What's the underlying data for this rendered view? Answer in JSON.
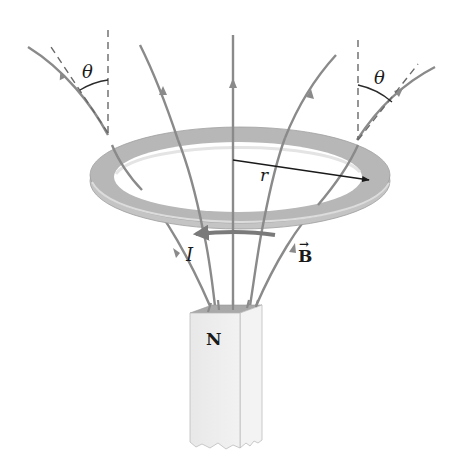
{
  "figure": {
    "labels": {
      "theta_left": "θ",
      "theta_right": "θ",
      "radius": "r",
      "current": "I",
      "field": "B",
      "field_vector_arrow": "→",
      "magnet_pole": "N"
    },
    "colors": {
      "field_line": "#8a8a8a",
      "ring_top": "#b5b5b5",
      "ring_edge": "#c9c9c9",
      "ring_highlight": "#e6e6e6",
      "magnet_front": "#ececec",
      "magnet_side": "#f4f4f4",
      "magnet_top": "#a8a8a8",
      "text": "#1a1a1a",
      "radius_arrow": "#1a1a1a",
      "current_arrow": "#7a7a7a",
      "dashed": "#6a6a6a"
    }
  }
}
